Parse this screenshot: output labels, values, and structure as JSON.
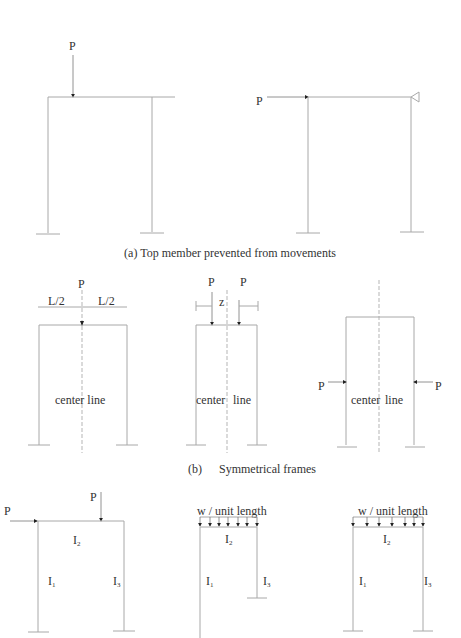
{
  "section_a": {
    "caption": "(a) Top member prevented from movements",
    "left_frame": {
      "load_label": "P"
    },
    "right_frame": {
      "load_label": "P"
    }
  },
  "section_b": {
    "caption_letter": "(b)",
    "caption_text": "Symmetrical frames",
    "frame1": {
      "load_label": "P",
      "dim_left": "L/2",
      "dim_right": "L/2",
      "centerline_label": "center line"
    },
    "frame2": {
      "load_left": "P",
      "load_right": "P",
      "dim_label": "z",
      "centerline_left": "center",
      "centerline_right": "line"
    },
    "frame3": {
      "load_left": "P",
      "load_right": "P",
      "centerline_left": "center",
      "centerline_right": "line"
    }
  },
  "section_c": {
    "frame1": {
      "load_horizontal": "P",
      "load_vertical": "P",
      "beam": "I",
      "beam_sub": "2",
      "left_col": "I",
      "left_sub": "1",
      "right_col": "I",
      "right_sub": "3"
    },
    "frame2": {
      "load_label": "w / unit length",
      "beam": "I",
      "beam_sub": "2",
      "left_col": "I",
      "left_sub": "1",
      "right_col": "I",
      "right_sub": "3"
    },
    "frame3": {
      "load_label": "w / unit length",
      "beam": "I",
      "beam_sub": "2",
      "left_col": "I",
      "left_sub": "1",
      "right_col": "I",
      "right_sub": "3"
    }
  }
}
